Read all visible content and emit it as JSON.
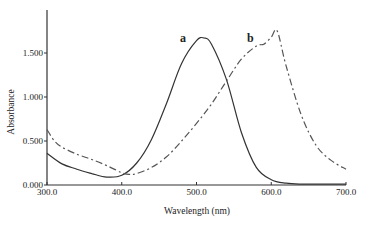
{
  "chart_data": {
    "type": "line",
    "title": "",
    "xlabel": "Wavelength (nm)",
    "ylabel": "Absorbance",
    "xlim": [
      300,
      700
    ],
    "ylim": [
      0,
      1.9
    ],
    "xticks": [
      300,
      400,
      500,
      600,
      700
    ],
    "xtick_labels": [
      "300.0",
      "400.0",
      "500.0",
      "600.0",
      "700.0"
    ],
    "yticks": [
      0,
      0.5,
      1.0,
      1.5
    ],
    "ytick_labels": [
      "0.000",
      "0.500",
      "1.000",
      "1.500"
    ],
    "grid": false,
    "legend": "inline labels",
    "series": [
      {
        "name": "a",
        "style": "solid",
        "color": "#333333",
        "label_at": [
          482,
          1.63
        ],
        "x": [
          300,
          320,
          340,
          360,
          380,
          400,
          420,
          440,
          460,
          480,
          500,
          510,
          520,
          540,
          560,
          580,
          600,
          620,
          640,
          660,
          680,
          700
        ],
        "y": [
          0.36,
          0.24,
          0.18,
          0.13,
          0.09,
          0.11,
          0.25,
          0.52,
          0.93,
          1.38,
          1.64,
          1.67,
          1.6,
          1.2,
          0.6,
          0.2,
          0.06,
          0.02,
          0.01,
          0.01,
          0.01,
          0.01
        ]
      },
      {
        "name": "b",
        "style": "dashed",
        "color": "#555555",
        "label_at": [
          572,
          1.63
        ],
        "x": [
          300,
          310,
          320,
          340,
          360,
          380,
          400,
          410,
          420,
          440,
          460,
          480,
          500,
          520,
          540,
          560,
          580,
          590,
          600,
          608,
          620,
          640,
          660,
          680,
          700
        ],
        "y": [
          0.63,
          0.5,
          0.43,
          0.35,
          0.29,
          0.22,
          0.14,
          0.12,
          0.13,
          0.2,
          0.32,
          0.5,
          0.7,
          0.92,
          1.18,
          1.43,
          1.58,
          1.6,
          1.68,
          1.75,
          1.35,
          0.8,
          0.45,
          0.28,
          0.18
        ]
      }
    ]
  }
}
